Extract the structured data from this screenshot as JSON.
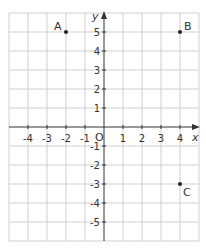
{
  "axes": {
    "x_label": "x",
    "y_label": "y",
    "origin_label": "O"
  },
  "x_ticks": [
    "-4",
    "-3",
    "-2",
    "-1",
    "1",
    "2",
    "3",
    "4"
  ],
  "y_ticks": [
    "5",
    "4",
    "3",
    "2",
    "1",
    "-1",
    "-2",
    "-3",
    "-4",
    "-5"
  ],
  "points": [
    {
      "label": "A",
      "x": -2,
      "y": 5
    },
    {
      "label": "B",
      "x": 4,
      "y": 5
    },
    {
      "label": "C",
      "x": 4,
      "y": -3
    }
  ],
  "colors": {
    "grid": "#c8c8c8",
    "axis": "#333333"
  }
}
